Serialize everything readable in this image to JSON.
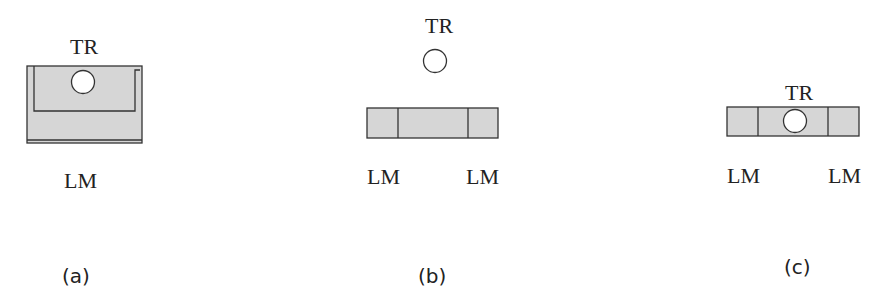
{
  "panels": [
    {
      "id": "a",
      "caption": "(a)",
      "top_label": "TR",
      "bottom_labels": [
        "LM"
      ],
      "description": "TR circle inside U-shaped region within LM block"
    },
    {
      "id": "b",
      "caption": "(b)",
      "top_label": "TR",
      "bottom_labels": [
        "LM",
        "LM"
      ],
      "description": "TR circle above segmented LM bar"
    },
    {
      "id": "c",
      "caption": "(c)",
      "top_label": "TR",
      "bottom_labels": [
        "LM",
        "LM"
      ],
      "description": "TR circle inside middle segment of LM bar"
    }
  ],
  "colors": {
    "fill": "#d6d6d6",
    "stroke": "#333333",
    "circle_fill": "#ffffff"
  }
}
